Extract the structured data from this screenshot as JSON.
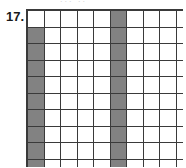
{
  "figure": {
    "item_number": "17.",
    "top_artifact_text": "...  ..",
    "grid": {
      "rows": 10,
      "cols": 10,
      "line_color": "#3a3a3a",
      "empty_color": "#ffffff",
      "shaded_color": "#828282",
      "shaded_columns": [
        1,
        6
      ],
      "description": "10 by 10 square grid; column 1 shaded in rows 2-10, column 6 shaded in rows 1-10",
      "cells": [
        [
          0,
          0,
          0,
          0,
          0,
          1,
          0,
          0,
          0,
          0
        ],
        [
          1,
          0,
          0,
          0,
          0,
          1,
          0,
          0,
          0,
          0
        ],
        [
          1,
          0,
          0,
          0,
          0,
          1,
          0,
          0,
          0,
          0
        ],
        [
          1,
          0,
          0,
          0,
          0,
          1,
          0,
          0,
          0,
          0
        ],
        [
          1,
          0,
          0,
          0,
          0,
          1,
          0,
          0,
          0,
          0
        ],
        [
          1,
          0,
          0,
          0,
          0,
          1,
          0,
          0,
          0,
          0
        ],
        [
          1,
          0,
          0,
          0,
          0,
          1,
          0,
          0,
          0,
          0
        ],
        [
          1,
          0,
          0,
          0,
          0,
          1,
          0,
          0,
          0,
          0
        ],
        [
          1,
          0,
          0,
          0,
          0,
          1,
          0,
          0,
          0,
          0
        ],
        [
          1,
          0,
          0,
          0,
          0,
          1,
          0,
          0,
          0,
          0
        ]
      ]
    }
  }
}
